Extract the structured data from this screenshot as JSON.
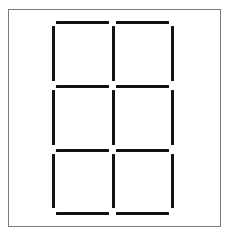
{
  "figure": {
    "background_color": "#ffffff",
    "matchstick_color": "#111111",
    "frame_color": "#7b7b7b",
    "total_matchsticks": 17,
    "squares_count": 6,
    "grid_columns": 2,
    "grid_rows": 3
  },
  "frame": {
    "x": 8,
    "y": 9,
    "width": 213,
    "height": 218,
    "border_width": 1
  },
  "grid_geometry": {
    "vertical_line_x": [
      53,
      113,
      172
    ],
    "horizontal_line_y": [
      22,
      86,
      150,
      213
    ],
    "stroke_thickness": 3,
    "gap": 5
  },
  "matchsticks": {
    "horizontal": [
      {
        "name": "h-r0-c0",
        "x": 56,
        "y": 21,
        "length": 53,
        "row": 0,
        "col": 0
      },
      {
        "name": "h-r0-c1",
        "x": 116,
        "y": 21,
        "length": 53,
        "row": 0,
        "col": 1
      },
      {
        "name": "h-r1-c0",
        "x": 56,
        "y": 85,
        "length": 53,
        "row": 1,
        "col": 0
      },
      {
        "name": "h-r1-c1",
        "x": 116,
        "y": 85,
        "length": 53,
        "row": 1,
        "col": 1
      },
      {
        "name": "h-r2-c0",
        "x": 56,
        "y": 149,
        "length": 53,
        "row": 2,
        "col": 0
      },
      {
        "name": "h-r2-c1",
        "x": 116,
        "y": 149,
        "length": 53,
        "row": 2,
        "col": 1
      },
      {
        "name": "h-r3-c0",
        "x": 56,
        "y": 212,
        "length": 53,
        "row": 3,
        "col": 0
      },
      {
        "name": "h-r3-c1",
        "x": 116,
        "y": 212,
        "length": 53,
        "row": 3,
        "col": 1
      }
    ],
    "vertical": [
      {
        "name": "v-r0-c0",
        "x": 52,
        "y": 26,
        "length": 55,
        "row": 0,
        "col": 0
      },
      {
        "name": "v-r0-c1",
        "x": 112,
        "y": 26,
        "length": 55,
        "row": 0,
        "col": 1
      },
      {
        "name": "v-r0-c2",
        "x": 171,
        "y": 26,
        "length": 55,
        "row": 0,
        "col": 2
      },
      {
        "name": "v-r1-c0",
        "x": 52,
        "y": 90,
        "length": 55,
        "row": 1,
        "col": 0
      },
      {
        "name": "v-r1-c1",
        "x": 112,
        "y": 90,
        "length": 55,
        "row": 1,
        "col": 1
      },
      {
        "name": "v-r1-c2",
        "x": 171,
        "y": 90,
        "length": 55,
        "row": 1,
        "col": 2
      },
      {
        "name": "v-r2-c0",
        "x": 52,
        "y": 154,
        "length": 54,
        "row": 2,
        "col": 0
      },
      {
        "name": "v-r2-c1",
        "x": 112,
        "y": 154,
        "length": 54,
        "row": 2,
        "col": 1
      },
      {
        "name": "v-r2-c2",
        "x": 171,
        "y": 154,
        "length": 54,
        "row": 2,
        "col": 2
      }
    ]
  }
}
